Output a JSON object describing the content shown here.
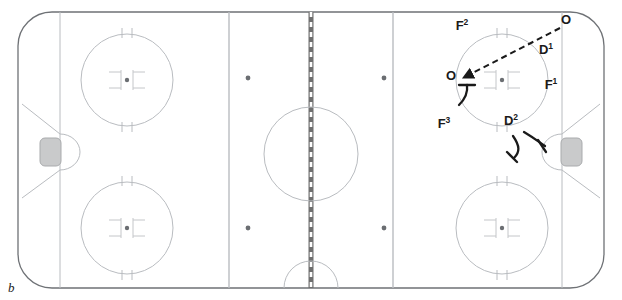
{
  "figure": {
    "panel_letter": "b",
    "type": "ice-hockey-rink-play-diagram"
  },
  "colors": {
    "ice": "#ffffff",
    "boards": "#6f7276",
    "rink_lines": "#b9bcc0",
    "center_line": "#6f6f6f",
    "faceoff_dot": "#6b6e72",
    "goal_fill": "#c9cacb",
    "annotation": "#1a1a1a"
  },
  "annotations": {
    "players": [
      {
        "id": "o-top-right",
        "base": "O",
        "sup": "",
        "x": 566,
        "y": 24
      },
      {
        "id": "f2",
        "base": "F",
        "sup": "2",
        "x": 462,
        "y": 30
      },
      {
        "id": "d1",
        "base": "D",
        "sup": "1",
        "x": 546,
        "y": 54
      },
      {
        "id": "o-left",
        "base": "O",
        "sup": "",
        "x": 451,
        "y": 80
      },
      {
        "id": "f1",
        "base": "F",
        "sup": "1",
        "x": 551,
        "y": 89
      },
      {
        "id": "f3",
        "base": "F",
        "sup": "3",
        "x": 444,
        "y": 128
      },
      {
        "id": "d2",
        "base": "D",
        "sup": "2",
        "x": 511,
        "y": 125
      }
    ],
    "pass_arrow": {
      "name": "dashed-pass-arrow",
      "from_label": "O",
      "to_label": "O",
      "style": "dashed-with-arrowhead"
    },
    "stick_marks": [
      {
        "name": "stick-check-f3"
      },
      {
        "name": "stick-check-d2-left"
      },
      {
        "name": "stick-check-d2-right"
      }
    ]
  },
  "rink": {
    "faceoff_circles": [
      {
        "name": "faceoff-circle-left-top",
        "cx": 127,
        "cy": 80,
        "r": 46
      },
      {
        "name": "faceoff-circle-left-bottom",
        "cx": 127,
        "cy": 228,
        "r": 46
      },
      {
        "name": "faceoff-circle-center",
        "cx": 311,
        "cy": 154,
        "r": 47
      },
      {
        "name": "faceoff-circle-right-top",
        "cx": 502,
        "cy": 80,
        "r": 46
      },
      {
        "name": "faceoff-circle-right-bottom",
        "cx": 502,
        "cy": 228,
        "r": 46
      }
    ],
    "neutral_dots": [
      {
        "name": "neutral-dot-upper-left",
        "cx": 248,
        "cy": 78
      },
      {
        "name": "neutral-dot-upper-right",
        "cx": 384,
        "cy": 78
      },
      {
        "name": "neutral-dot-lower-left",
        "cx": 248,
        "cy": 228
      },
      {
        "name": "neutral-dot-lower-right",
        "cx": 384,
        "cy": 228
      }
    ],
    "blue_lines": [
      {
        "name": "blue-line-left",
        "x": 229
      },
      {
        "name": "blue-line-right",
        "x": 393
      }
    ],
    "goal_lines": [
      {
        "name": "goal-line-left",
        "x": 60
      },
      {
        "name": "goal-line-right",
        "x": 562
      }
    ],
    "center_line": {
      "name": "center-red-line",
      "x": 311
    },
    "goals": [
      {
        "name": "goal-net-left"
      },
      {
        "name": "goal-net-right"
      }
    ],
    "referee_crease": {
      "name": "referee-crease",
      "cx": 311,
      "cy": 288,
      "r": 27
    }
  }
}
